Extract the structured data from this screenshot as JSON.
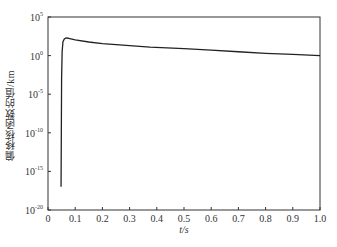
{
  "chart_data": {
    "type": "line",
    "title": "",
    "xlabel": "t/s",
    "ylabel": "偏移核函数的值/km",
    "xlim": [
      0,
      1.0
    ],
    "ylim_log10": [
      -20,
      5
    ],
    "yscale": "log",
    "grid": false,
    "legend": null,
    "x_ticks": [
      "0",
      "0.1",
      "0.2",
      "0.3",
      "0.4",
      "0.5",
      "0.6",
      "0.7",
      "0.8",
      "0.9",
      "1.0"
    ],
    "y_ticks": [
      {
        "exp": "5",
        "value_log10": 5
      },
      {
        "exp": "0",
        "value_log10": 0
      },
      {
        "exp": "-5",
        "value_log10": -5
      },
      {
        "exp": "-10",
        "value_log10": -10
      },
      {
        "exp": "-15",
        "value_log10": -15
      },
      {
        "exp": "-20",
        "value_log10": -20
      }
    ],
    "series": [
      {
        "name": "migration kernel",
        "x": [
          0.048,
          0.049,
          0.05,
          0.052,
          0.055,
          0.06,
          0.065,
          0.07,
          0.08,
          0.1,
          0.15,
          0.2,
          0.3,
          0.375,
          0.5,
          0.6,
          0.7,
          0.8,
          0.9,
          1.0
        ],
        "y_log10": [
          -17.0,
          -10.0,
          -3.0,
          0.5,
          1.8,
          2.15,
          2.25,
          2.28,
          2.2,
          2.05,
          1.76,
          1.55,
          1.3,
          1.1,
          0.9,
          0.7,
          0.5,
          0.3,
          0.15,
          0.0
        ]
      }
    ]
  }
}
